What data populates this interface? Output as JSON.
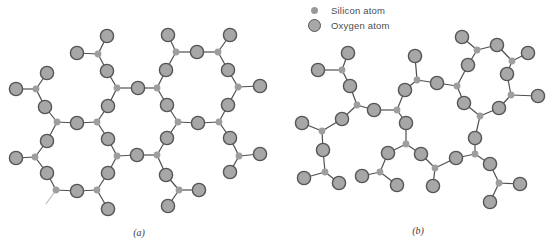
{
  "legend": {
    "items": [
      {
        "swatch": "silicon",
        "label": "Silicon atom"
      },
      {
        "swatch": "oxygen",
        "label": "Oxygen atom"
      }
    ]
  },
  "style": {
    "colors": {
      "background": "#ffffff",
      "bond": "#4f4f4f",
      "bond_stub": "#bcbcbc",
      "oxygen_fill": "#a7a7a7",
      "oxygen_stroke": "#555555",
      "silicon_fill": "#9e9e9e",
      "legend_text": "#4d4d4d",
      "caption_text": "#3a3a3a"
    },
    "oxygen_radius": 6.6,
    "silicon_radius": 3.4,
    "bond_width": 1.2,
    "oxygen_stroke_width": 1.4
  },
  "panels": [
    {
      "id": "a",
      "caption": "(a)",
      "description": "crystalline silicon dioxide (regular hexagonal network)",
      "silicon": [
        [
          98,
          54
        ],
        [
          176,
          52
        ],
        [
          218,
          52
        ],
        [
          36,
          89
        ],
        [
          117,
          88
        ],
        [
          157,
          88
        ],
        [
          238,
          87
        ],
        [
          57,
          122
        ],
        [
          97,
          122
        ],
        [
          178,
          122
        ],
        [
          219,
          122
        ],
        [
          35,
          157
        ],
        [
          117,
          156
        ],
        [
          157,
          155
        ],
        [
          239,
          156
        ],
        [
          56,
          190
        ],
        [
          97,
          190
        ],
        [
          179,
          190
        ]
      ],
      "oxygen": [
        [
          107,
          71
        ],
        [
          138,
          88
        ],
        [
          166,
          70
        ],
        [
          197,
          52
        ],
        [
          228,
          70
        ],
        [
          45,
          107
        ],
        [
          108,
          106
        ],
        [
          167,
          105
        ],
        [
          228,
          105
        ],
        [
          77,
          123
        ],
        [
          198,
          123
        ],
        [
          47,
          141
        ],
        [
          108,
          139
        ],
        [
          167,
          138
        ],
        [
          230,
          138
        ],
        [
          47,
          173
        ],
        [
          108,
          173
        ],
        [
          166,
          175
        ],
        [
          137,
          155
        ],
        [
          77,
          191
        ],
        [
          77,
          53
        ],
        [
          107,
          36
        ],
        [
          168,
          35
        ],
        [
          230,
          35
        ],
        [
          16,
          89
        ],
        [
          47,
          73
        ],
        [
          260,
          86
        ],
        [
          16,
          158
        ],
        [
          260,
          154
        ],
        [
          230,
          172
        ],
        [
          108,
          209
        ],
        [
          199,
          190
        ],
        [
          168,
          206
        ]
      ],
      "bonds": [
        [
          0,
          20
        ],
        [
          0,
          21
        ],
        [
          0,
          0
        ],
        [
          1,
          22
        ],
        [
          1,
          2
        ],
        [
          1,
          3
        ],
        [
          2,
          3
        ],
        [
          2,
          23
        ],
        [
          2,
          4
        ],
        [
          3,
          24
        ],
        [
          3,
          25
        ],
        [
          3,
          5
        ],
        [
          4,
          0
        ],
        [
          4,
          1
        ],
        [
          4,
          6
        ],
        [
          5,
          1
        ],
        [
          5,
          2
        ],
        [
          5,
          7
        ],
        [
          6,
          4
        ],
        [
          6,
          26
        ],
        [
          6,
          8
        ],
        [
          7,
          5
        ],
        [
          7,
          9
        ],
        [
          7,
          11
        ],
        [
          8,
          9
        ],
        [
          8,
          6
        ],
        [
          8,
          12
        ],
        [
          9,
          7
        ],
        [
          9,
          10
        ],
        [
          9,
          13
        ],
        [
          10,
          10
        ],
        [
          10,
          8
        ],
        [
          10,
          14
        ],
        [
          11,
          27
        ],
        [
          11,
          11
        ],
        [
          11,
          15
        ],
        [
          12,
          12
        ],
        [
          12,
          18
        ],
        [
          12,
          16
        ],
        [
          13,
          18
        ],
        [
          13,
          13
        ],
        [
          13,
          17
        ],
        [
          14,
          14
        ],
        [
          14,
          28
        ],
        [
          14,
          29
        ],
        [
          15,
          15
        ],
        [
          15,
          19
        ],
        [
          16,
          19
        ],
        [
          16,
          16
        ],
        [
          16,
          30
        ],
        [
          17,
          17
        ],
        [
          17,
          31
        ],
        [
          17,
          32
        ]
      ],
      "stub_bonds": [
        [
          [
            56,
            190
          ],
          [
            46,
            204
          ]
        ]
      ]
    },
    {
      "id": "b",
      "caption": "(b)",
      "description": "amorphous silicon dioxide (disordered network)",
      "silicon": [
        [
          342,
          70
        ],
        [
          357,
          105
        ],
        [
          322,
          131
        ],
        [
          325,
          172
        ],
        [
          397,
          110
        ],
        [
          417,
          80
        ],
        [
          457,
          86
        ],
        [
          406,
          144
        ],
        [
          380,
          172
        ],
        [
          480,
          116
        ],
        [
          435,
          168
        ],
        [
          475,
          154
        ],
        [
          499,
          183
        ],
        [
          477,
          50
        ],
        [
          512,
          61
        ],
        [
          511,
          95
        ]
      ],
      "oxygen": [
        [
          350,
          86
        ],
        [
          342,
          119
        ],
        [
          323,
          150
        ],
        [
          374,
          110
        ],
        [
          405,
          90
        ],
        [
          437,
          83
        ],
        [
          468,
          65
        ],
        [
          464,
          103
        ],
        [
          406,
          123
        ],
        [
          388,
          153
        ],
        [
          421,
          154
        ],
        [
          456,
          158
        ],
        [
          475,
          138
        ],
        [
          490,
          164
        ],
        [
          497,
          45
        ],
        [
          507,
          74
        ],
        [
          499,
          108
        ],
        [
          348,
          53
        ],
        [
          318,
          70
        ],
        [
          302,
          123
        ],
        [
          304,
          178
        ],
        [
          339,
          183
        ],
        [
          362,
          176
        ],
        [
          397,
          185
        ],
        [
          415,
          56
        ],
        [
          462,
          37
        ],
        [
          528,
          53
        ],
        [
          538,
          96
        ],
        [
          433,
          186
        ],
        [
          520,
          184
        ],
        [
          490,
          202
        ]
      ],
      "bonds": [
        [
          0,
          17
        ],
        [
          0,
          18
        ],
        [
          0,
          0
        ],
        [
          1,
          0
        ],
        [
          1,
          1
        ],
        [
          1,
          3
        ],
        [
          2,
          1
        ],
        [
          2,
          19
        ],
        [
          2,
          2
        ],
        [
          3,
          2
        ],
        [
          3,
          20
        ],
        [
          3,
          21
        ],
        [
          4,
          3
        ],
        [
          4,
          4
        ],
        [
          4,
          8
        ],
        [
          5,
          4
        ],
        [
          5,
          24
        ],
        [
          5,
          5
        ],
        [
          6,
          5
        ],
        [
          6,
          6
        ],
        [
          6,
          7
        ],
        [
          7,
          8
        ],
        [
          7,
          9
        ],
        [
          7,
          10
        ],
        [
          8,
          9
        ],
        [
          8,
          22
        ],
        [
          8,
          23
        ],
        [
          9,
          7
        ],
        [
          9,
          16
        ],
        [
          9,
          12
        ],
        [
          10,
          10
        ],
        [
          10,
          11
        ],
        [
          10,
          28
        ],
        [
          11,
          11
        ],
        [
          11,
          12
        ],
        [
          11,
          13
        ],
        [
          12,
          13
        ],
        [
          12,
          29
        ],
        [
          12,
          30
        ],
        [
          13,
          25
        ],
        [
          13,
          14
        ],
        [
          13,
          6
        ],
        [
          14,
          14
        ],
        [
          14,
          26
        ],
        [
          14,
          15
        ],
        [
          15,
          15
        ],
        [
          15,
          16
        ],
        [
          15,
          27
        ]
      ],
      "stub_bonds": []
    }
  ]
}
